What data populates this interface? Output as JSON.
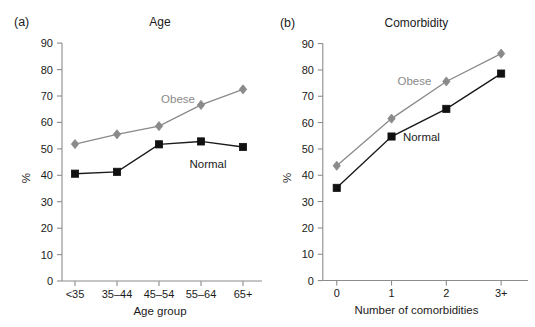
{
  "figure": {
    "background_color": "#ffffff",
    "obese_color": "#8a8a8a",
    "normal_color": "#111111",
    "axis_color": "#8c8c8c"
  },
  "panels": [
    {
      "letter": "(a)",
      "title": "Age",
      "ylabel": "%",
      "xlabel": "Age group",
      "categories": [
        "<35",
        "35–44",
        "45–54",
        "55–64",
        "65+"
      ],
      "yticks": [
        "0",
        "10",
        "20",
        "30",
        "40",
        "50",
        "60",
        "70",
        "80",
        "90"
      ],
      "series": [
        {
          "name": "Obese",
          "label": "Obese"
        },
        {
          "name": "Normal",
          "label": "Normal"
        }
      ]
    },
    {
      "letter": "(b)",
      "title": "Comorbidity",
      "ylabel": "%",
      "xlabel": "Number of comorbidities",
      "categories": [
        "0",
        "1",
        "2",
        "3+"
      ],
      "yticks": [
        "0",
        "10",
        "20",
        "30",
        "40",
        "50",
        "60",
        "70",
        "80",
        "90"
      ],
      "series": [
        {
          "name": "Obese",
          "label": "Obese"
        },
        {
          "name": "Normal",
          "label": "Normal"
        }
      ]
    }
  ],
  "chart_data": [
    {
      "type": "line",
      "title": "Age",
      "panel": "(a)",
      "xlabel": "Age group",
      "ylabel": "%",
      "categories": [
        "<35",
        "35–44",
        "45–54",
        "55–64",
        "65+"
      ],
      "ylim": [
        0,
        90
      ],
      "ytick_step": 10,
      "grid": false,
      "legend": "inline-labels",
      "series": [
        {
          "name": "Obese",
          "values": [
            51.8,
            55.5,
            58.6,
            66.6,
            72.5
          ],
          "color": "#8a8a8a",
          "marker": "diamond"
        },
        {
          "name": "Normal",
          "values": [
            40.6,
            41.3,
            51.7,
            52.8,
            50.7
          ],
          "color": "#111111",
          "marker": "square"
        }
      ]
    },
    {
      "type": "line",
      "title": "Comorbidity",
      "panel": "(b)",
      "xlabel": "Number of comorbidities",
      "ylabel": "%",
      "categories": [
        "0",
        "1",
        "2",
        "3+"
      ],
      "ylim": [
        0,
        90
      ],
      "ytick_step": 10,
      "grid": false,
      "legend": "inline-labels",
      "series": [
        {
          "name": "Obese",
          "values": [
            43.6,
            61.5,
            75.6,
            86.2
          ],
          "color": "#8a8a8a",
          "marker": "diamond"
        },
        {
          "name": "Normal",
          "values": [
            35.2,
            54.7,
            65.2,
            78.6
          ],
          "color": "#111111",
          "marker": "square"
        }
      ]
    }
  ]
}
